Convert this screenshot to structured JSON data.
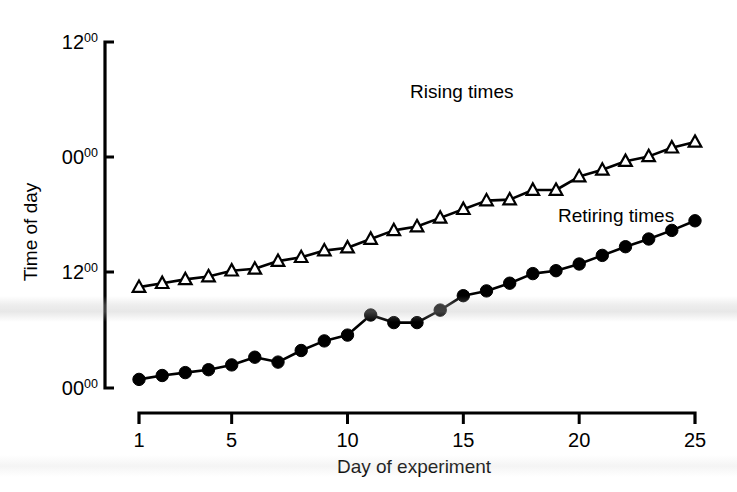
{
  "chart_data": {
    "type": "line",
    "title": "",
    "xlabel": "Day of experiment",
    "ylabel": "Time of day",
    "x": [
      1,
      2,
      3,
      4,
      5,
      6,
      7,
      8,
      9,
      10,
      11,
      12,
      13,
      14,
      15,
      16,
      17,
      18,
      19,
      20,
      21,
      22,
      23,
      24,
      25
    ],
    "xlim": [
      1,
      25
    ],
    "xticks": [
      1,
      5,
      10,
      15,
      20,
      25
    ],
    "xtick_labels": [
      "1",
      "5",
      "10",
      "15",
      "20",
      "25"
    ],
    "ylim_hours": [
      0,
      36
    ],
    "yticks_hours": [
      0,
      12,
      24,
      36
    ],
    "ytick_labels": [
      "00",
      "12",
      "00",
      "12"
    ],
    "ytick_superscripts": [
      "00",
      "00",
      "00",
      "00"
    ],
    "grid": false,
    "legend_position": "inline-annotations",
    "series": [
      {
        "name": "Rising times",
        "marker": "open-triangle",
        "label_text": "Rising times",
        "values_hours": [
          10.5,
          10.9,
          11.3,
          11.6,
          12.2,
          12.4,
          13.2,
          13.6,
          14.3,
          14.6,
          15.5,
          16.4,
          16.8,
          17.7,
          18.6,
          19.5,
          19.6,
          20.6,
          20.6,
          22.0,
          22.7,
          23.6,
          24.1,
          25.0,
          25.6
        ]
      },
      {
        "name": "Retiring times",
        "marker": "filled-circle",
        "label_text": "Retiring times",
        "values_hours": [
          0.9,
          1.3,
          1.6,
          1.9,
          2.4,
          3.2,
          2.7,
          3.9,
          4.9,
          5.5,
          7.6,
          6.8,
          6.8,
          8.1,
          9.6,
          10.1,
          10.9,
          11.9,
          12.2,
          12.9,
          13.8,
          14.7,
          15.5,
          16.4,
          17.4
        ]
      }
    ],
    "annotations": [
      {
        "text": "Rising times",
        "x_px": 410,
        "y_px": 98
      },
      {
        "text": "Retiring times",
        "x_px": 558,
        "y_px": 222
      }
    ]
  },
  "axes": {
    "y_axis_name": "time-of-day-axis",
    "x_axis_name": "day-of-experiment-axis"
  }
}
